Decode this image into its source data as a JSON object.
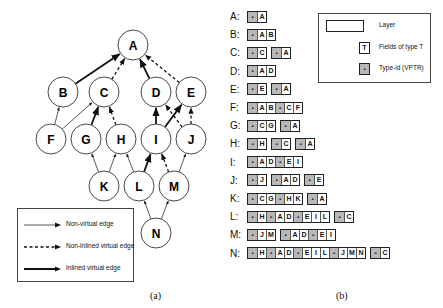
{
  "graph": {
    "nodes": [
      {
        "id": "A",
        "x": 133,
        "y": 45
      },
      {
        "id": "B",
        "x": 63,
        "y": 92
      },
      {
        "id": "C",
        "x": 104,
        "y": 92
      },
      {
        "id": "D",
        "x": 156,
        "y": 92
      },
      {
        "id": "E",
        "x": 191,
        "y": 92
      },
      {
        "id": "F",
        "x": 51,
        "y": 139
      },
      {
        "id": "G",
        "x": 86,
        "y": 139
      },
      {
        "id": "H",
        "x": 121,
        "y": 139
      },
      {
        "id": "I",
        "x": 156,
        "y": 139
      },
      {
        "id": "J",
        "x": 191,
        "y": 139
      },
      {
        "id": "K",
        "x": 104,
        "y": 186
      },
      {
        "id": "L",
        "x": 139,
        "y": 186
      },
      {
        "id": "M",
        "x": 174,
        "y": 186
      },
      {
        "id": "N",
        "x": 156,
        "y": 233
      }
    ],
    "edges": [
      {
        "from": "B",
        "to": "A",
        "type": "inlined"
      },
      {
        "from": "C",
        "to": "A",
        "type": "non-inlined"
      },
      {
        "from": "D",
        "to": "A",
        "type": "inlined"
      },
      {
        "from": "E",
        "to": "A",
        "type": "non-inlined"
      },
      {
        "from": "F",
        "to": "B",
        "type": "non-virtual"
      },
      {
        "from": "F",
        "to": "C",
        "type": "non-virtual"
      },
      {
        "from": "G",
        "to": "C",
        "type": "inlined"
      },
      {
        "from": "H",
        "to": "C",
        "type": "non-inlined"
      },
      {
        "from": "I",
        "to": "D",
        "type": "inlined"
      },
      {
        "from": "I",
        "to": "E",
        "type": "inlined"
      },
      {
        "from": "J",
        "to": "D",
        "type": "non-inlined"
      },
      {
        "from": "J",
        "to": "E",
        "type": "non-inlined"
      },
      {
        "from": "K",
        "to": "G",
        "type": "non-virtual"
      },
      {
        "from": "K",
        "to": "H",
        "type": "non-virtual"
      },
      {
        "from": "L",
        "to": "H",
        "type": "non-virtual"
      },
      {
        "from": "L",
        "to": "I",
        "type": "inlined"
      },
      {
        "from": "M",
        "to": "I",
        "type": "non-inlined"
      },
      {
        "from": "M",
        "to": "J",
        "type": "non-virtual"
      },
      {
        "from": "N",
        "to": "L",
        "type": "non-virtual"
      },
      {
        "from": "N",
        "to": "M",
        "type": "non-virtual"
      }
    ],
    "legend": [
      {
        "type": "non-virtual",
        "label": "Non-virtual edge"
      },
      {
        "type": "non-inlined",
        "label": "Non-inlined virtual edge"
      },
      {
        "type": "inlined",
        "label": "Inlined virtual edge"
      }
    ],
    "caption": "(a)"
  },
  "layouts": {
    "caption": "(b)",
    "vptr_glyph": "▪",
    "rows": [
      {
        "label": "A:",
        "layers": [
          [
            "*",
            "A"
          ]
        ]
      },
      {
        "label": "B:",
        "layers": [
          [
            "*",
            "A",
            "B"
          ]
        ]
      },
      {
        "label": "C:",
        "layers": [
          [
            "*",
            "C"
          ],
          [
            "*",
            "A"
          ]
        ]
      },
      {
        "label": "D:",
        "layers": [
          [
            "*",
            "A",
            "D"
          ]
        ]
      },
      {
        "label": "E:",
        "layers": [
          [
            "*",
            "E"
          ],
          [
            "*",
            "A"
          ]
        ]
      },
      {
        "label": "F:",
        "layers": [
          [
            "*",
            "A",
            "B",
            "*",
            "C",
            "F"
          ]
        ]
      },
      {
        "label": "G:",
        "layers": [
          [
            "*",
            "C",
            "G"
          ],
          [
            "*",
            "A"
          ]
        ]
      },
      {
        "label": "H:",
        "layers": [
          [
            "*",
            "H"
          ],
          [
            "*",
            "C"
          ],
          [
            "*",
            "A"
          ]
        ]
      },
      {
        "label": "I:",
        "layers": [
          [
            "*",
            "A",
            "D",
            "*",
            "E",
            "I"
          ]
        ]
      },
      {
        "label": "J:",
        "layers": [
          [
            "*",
            "J"
          ],
          [
            "*",
            "A",
            "D"
          ],
          [
            "*",
            "E"
          ]
        ]
      },
      {
        "label": "K:",
        "layers": [
          [
            "*",
            "C",
            "G",
            "*",
            "H",
            "K"
          ],
          [
            "*",
            "A"
          ]
        ]
      },
      {
        "label": "L:",
        "layers": [
          [
            "*",
            "H",
            "*",
            "A",
            "D",
            "*",
            "E",
            "I",
            "L"
          ],
          [
            "*",
            "C"
          ]
        ]
      },
      {
        "label": "M:",
        "layers": [
          [
            "*",
            "J",
            "M"
          ],
          [
            "*",
            "A",
            "D",
            "*",
            "E",
            "I"
          ]
        ]
      },
      {
        "label": "N:",
        "layers": [
          [
            "*",
            "H",
            "*",
            "A",
            "D",
            "*",
            "E",
            "I",
            "L",
            "*",
            "J",
            "M",
            "N"
          ],
          [
            "*",
            "C"
          ]
        ]
      }
    ],
    "legend": {
      "layer_label": "Layer",
      "field_sample": "T",
      "field_label": "Fields of type T",
      "vptr_label": "Type-id (VPTR)"
    }
  }
}
